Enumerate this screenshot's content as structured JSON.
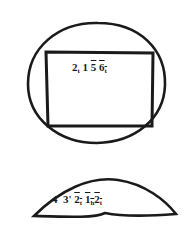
{
  "diagram": {
    "top_figure": {
      "shape": "circle-with-inscribed-rectangle",
      "label_parts": [
        "2",
        "t",
        "1",
        "5",
        "6",
        "t"
      ],
      "label_text": "2_t 1 5̄ 6̄_t"
    },
    "bottom_figure": {
      "shape": "lens",
      "label_parts": [
        "4",
        "3'",
        "2",
        "t",
        "1",
        "h",
        "2",
        "t"
      ],
      "label_text": "4 3' 2̄_t 1̄_h 2̄_t"
    },
    "colors": {
      "stroke": "#1a1a1a",
      "background": "#ffffff"
    }
  }
}
